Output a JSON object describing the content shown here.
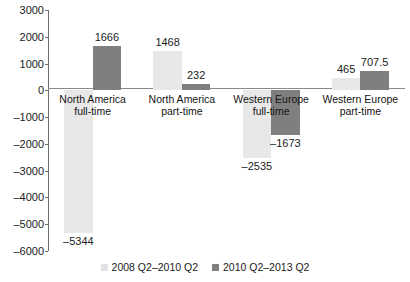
{
  "chart_data": {
    "type": "bar",
    "title": "",
    "subtitle": "",
    "xlabel": "",
    "ylabel": "",
    "ylim": [
      -6000,
      3000
    ],
    "ytick_labels": [
      "3000",
      "2000",
      "1000",
      "0",
      "–1000",
      "–2000",
      "–3000",
      "–4000",
      "–5000",
      "–6000"
    ],
    "ytick_values": [
      3000,
      2000,
      1000,
      0,
      -1000,
      -2000,
      -3000,
      -4000,
      -5000,
      -6000
    ],
    "grid": false,
    "legend_position": "bottom",
    "categories": [
      "North America full-time",
      "North America part-time",
      "Western Europe full-time",
      "Western Europe part-time"
    ],
    "category_label_lines": [
      [
        "North America",
        "full-time"
      ],
      [
        "North America",
        "part-time"
      ],
      [
        "Western Europe",
        "full-time"
      ],
      [
        "Western Europe",
        "part-time"
      ]
    ],
    "series": [
      {
        "name": "2008 Q2–2010 Q2",
        "color": "#e8e8e8",
        "values": [
          -5344,
          1468,
          -2535,
          465
        ],
        "value_labels": [
          "–5344",
          "1468",
          "–2535",
          "465"
        ]
      },
      {
        "name": "2010 Q2–2013 Q2",
        "color": "#7f7f7f",
        "values": [
          1666,
          232,
          -1673,
          707.5
        ],
        "value_labels": [
          "1666",
          "232",
          "–1673",
          "707.5"
        ]
      }
    ]
  },
  "axis": {
    "ticks": [
      {
        "label": "3000",
        "value": 3000
      },
      {
        "label": "2000",
        "value": 2000
      },
      {
        "label": "1000",
        "value": 1000
      },
      {
        "label": "0",
        "value": 0
      },
      {
        "label": "–1000",
        "value": -1000
      },
      {
        "label": "–2000",
        "value": -2000
      },
      {
        "label": "–3000",
        "value": -3000
      },
      {
        "label": "–4000",
        "value": -4000
      },
      {
        "label": "–5000",
        "value": -5000
      },
      {
        "label": "–6000",
        "value": -6000
      }
    ]
  },
  "legend": {
    "items": [
      {
        "label": "2008 Q2–2010 Q2",
        "swatch": "light"
      },
      {
        "label": "2010 Q2–2013 Q2",
        "swatch": "dark"
      }
    ]
  }
}
